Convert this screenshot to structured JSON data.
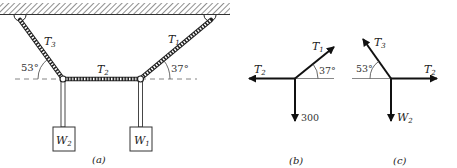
{
  "figure": {
    "panels": [
      {
        "id": "a",
        "caption": "(a)",
        "labels": {
          "t3": "T",
          "t3_sub": "3",
          "t1": "T",
          "t1_sub": "1",
          "t2": "T",
          "t2_sub": "2",
          "angle_left": "53°",
          "angle_right": "37°",
          "w2": "W",
          "w2_sub": "2",
          "w1": "W",
          "w1_sub": "1"
        }
      },
      {
        "id": "b",
        "caption": "(b)",
        "labels": {
          "t2": "T",
          "t2_sub": "2",
          "t1": "T",
          "t1_sub": "1",
          "angle": "37°",
          "load": "300"
        }
      },
      {
        "id": "c",
        "caption": "(c)",
        "labels": {
          "t3": "T",
          "t3_sub": "3",
          "t2": "T",
          "t2_sub": "2",
          "angle": "53°",
          "w": "W",
          "w_sub": "2"
        }
      }
    ],
    "colors": {
      "line": "#111111",
      "rope_fill": "#ffffff",
      "dashed": "#555555",
      "hatch": "#444444"
    }
  }
}
